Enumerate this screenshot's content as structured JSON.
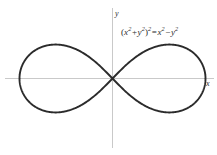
{
  "figure": {
    "background_color": "#ffffff",
    "curve_color": "#2b2b2b",
    "axis_color": "#c9c9c9",
    "text_color": "#2b2b2b"
  },
  "axes": {
    "x_label": "x",
    "y_label": "y"
  },
  "equation": {
    "full_text": "(x^2 + y^2)^2 = x^2 - y^2",
    "open_paren": "(",
    "base_x1": "x",
    "exp_2a": "2",
    "plus": "+",
    "base_y1": "y",
    "exp_2b": "2",
    "close_paren": ")",
    "exp_outer": "2",
    "equals": "=",
    "base_x2": "x",
    "exp_2c": "2",
    "minus": "−",
    "base_y2": "y",
    "exp_2d": "2"
  },
  "chart_data": {
    "type": "line",
    "title": "",
    "subtitle": "",
    "xlabel": "x",
    "ylabel": "y",
    "grid": false,
    "legend": null,
    "annotations": [
      {
        "text": "(x^2 + y^2)^2 = x^2 - y^2",
        "x": 0.45,
        "y": 0.72
      }
    ],
    "curve_name": "Lemniscate of Bernoulli",
    "implicit_equation": "(x^2 + y^2)^2 = x^2 - y^2",
    "polar_equation": "r^2 = cos(2*theta)",
    "xlim": [
      -1.15,
      1.1
    ],
    "ylim": [
      -0.75,
      0.75
    ],
    "x_axis_range_pixels": [
      5,
      214
    ],
    "y_axis_range_pixels": [
      8,
      148
    ],
    "origin_pixel": [
      112,
      78
    ],
    "x_extent": [
      -1.0,
      1.0
    ],
    "y_extent": [
      -0.3536,
      0.3536
    ],
    "self_intersection": [
      0,
      0
    ],
    "tangent_angles_at_origin_deg": [
      45,
      -45
    ],
    "series": [
      {
        "name": "Lemniscate of Bernoulli",
        "points_x": [
          1.0,
          0.99,
          0.966,
          0.924,
          0.866,
          0.793,
          0.707,
          0.609,
          0.5,
          0.383,
          0.259,
          0.131,
          0.0,
          -0.131,
          -0.259,
          -0.383,
          -0.5,
          -0.609,
          -0.707,
          -0.793,
          -0.866,
          -0.924,
          -0.966,
          -0.99,
          -1.0
        ],
        "points_y": [
          0.0,
          0.099,
          0.183,
          0.248,
          0.293,
          0.322,
          0.336,
          0.339,
          0.333,
          0.318,
          0.293,
          0.253,
          0.0,
          -0.253,
          -0.293,
          -0.318,
          -0.333,
          -0.339,
          -0.336,
          -0.322,
          -0.293,
          -0.248,
          -0.183,
          -0.099,
          0.0
        ]
      }
    ]
  }
}
